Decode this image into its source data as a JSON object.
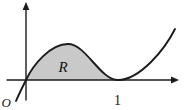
{
  "figure": {
    "origin_label": "O",
    "region_label": "R",
    "x_tick_label": "1",
    "key_points": {
      "curve_through_origin": {
        "x": 0,
        "y": 0
      },
      "tangent_touch_point": {
        "x": 1,
        "y": 0
      },
      "shaded_interval": [
        0,
        1
      ]
    }
  },
  "colors": {
    "region_fill": "#c9c9c9",
    "line": "#1b1b1b",
    "background": "#ffffff"
  }
}
